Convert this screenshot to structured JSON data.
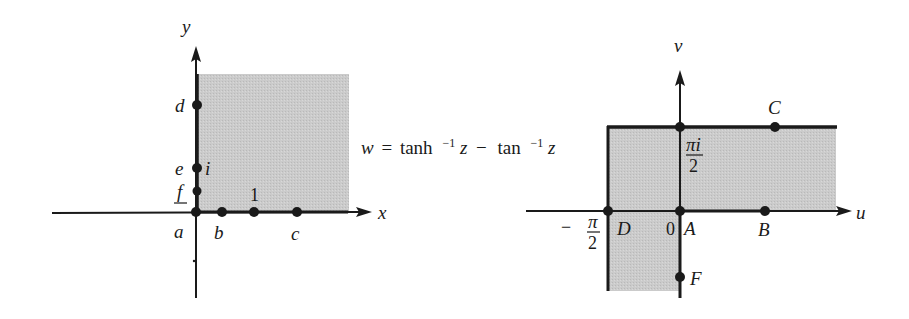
{
  "equation": {
    "lhs": "w",
    "eq": "=",
    "term1": "tanh",
    "minus": "−",
    "term2": "tan",
    "sup": "−1",
    "var": "z"
  },
  "z_plane": {
    "axes": {
      "horizontal": "x",
      "vertical": "y"
    },
    "points": {
      "a": "a",
      "b": "b",
      "c": "c",
      "d": "d",
      "e": "e",
      "f": "f",
      "one": "1",
      "i": "i"
    }
  },
  "w_plane": {
    "axes": {
      "horizontal": "u",
      "vertical": "v"
    },
    "points": {
      "A": "A",
      "B": "B",
      "C": "C",
      "D": "D",
      "F": "F",
      "origin": "0"
    },
    "ticks": {
      "pi_i_num": "πi",
      "pi_num": "π",
      "den": "2",
      "neg": "−"
    }
  },
  "colors": {
    "shade": "#c9c9c9",
    "ink": "#1a1a1a"
  }
}
